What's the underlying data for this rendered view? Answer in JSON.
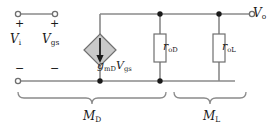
{
  "figure": {
    "kind": "small-signal-equivalent-circuit",
    "colors": {
      "wire": "#8a8a8a",
      "node": "#1a1a1a",
      "text": "#1a1a1a",
      "source_fill": "#c9c9c9",
      "source_stroke": "#6f6f6f",
      "resistor_fill": "#ffffff",
      "resistor_stroke": "#6f6f6f",
      "brace": "#8a8a8a"
    },
    "terminals": [
      {
        "name": "input-top-terminal",
        "polarity": "+"
      },
      {
        "name": "gate-source-top-terminal",
        "polarity": "+"
      },
      {
        "name": "input-bottom-terminal",
        "polarity": "-"
      },
      {
        "name": "output-terminal",
        "polarity": ""
      }
    ],
    "labels": {
      "input_voltage": "V",
      "input_voltage_sub": "i",
      "gate_source_voltage": "V",
      "gate_source_voltage_sub": "gs",
      "dependent_source": "g",
      "dependent_source_sub1": "mD",
      "dependent_source_v": "V",
      "dependent_source_sub2": "gs",
      "resistor_drain": "r",
      "resistor_drain_sub": "oD",
      "resistor_load": "r",
      "resistor_load_sub": "oL",
      "output_voltage": "V",
      "output_voltage_sub": "o",
      "bracket_left": "M",
      "bracket_left_sub": "D",
      "bracket_right": "M",
      "bracket_right_sub": "L",
      "plus_left": "+",
      "plus_right": "+",
      "minus_left": "−",
      "minus_right": "−"
    },
    "components": [
      {
        "name": "dependent-current-source",
        "type": "vccs-diamond",
        "arrow": "down",
        "label": "gmDVgs"
      },
      {
        "name": "resistor-rod",
        "type": "resistor",
        "label": "roD"
      },
      {
        "name": "resistor-rol",
        "type": "resistor",
        "label": "roL"
      }
    ],
    "brackets": [
      {
        "name": "bracket-md",
        "label": "MD",
        "span": "input through roD"
      },
      {
        "name": "bracket-ml",
        "label": "ML",
        "span": "roL"
      }
    ]
  }
}
